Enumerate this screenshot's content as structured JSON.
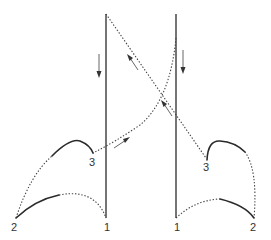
{
  "diagram": {
    "labels": {
      "left_2": "2",
      "left_1": "1",
      "left_3": "3",
      "right_1": "1",
      "right_2": "2",
      "right_3": "3"
    },
    "colors": {
      "line": "#2a2a2a",
      "background": "#ffffff"
    }
  }
}
